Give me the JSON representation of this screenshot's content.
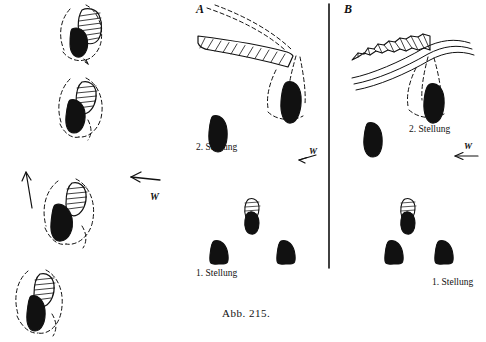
{
  "figure": {
    "caption": "Abb. 215.",
    "panels": [
      {
        "id": "A",
        "letter": "A"
      },
      {
        "id": "B",
        "letter": "B"
      }
    ],
    "labels": [
      {
        "name": "panel-a-letter",
        "text": "A",
        "x": 196,
        "y": 4
      },
      {
        "name": "panel-b-letter",
        "text": "B",
        "x": 344,
        "y": 4
      },
      {
        "name": "panel-a-second-position",
        "text": "2. Stellung",
        "x": 196,
        "y": 143
      },
      {
        "name": "panel-a-first-position",
        "text": "1. Stellung",
        "x": 196,
        "y": 268
      },
      {
        "name": "panel-b-second-position",
        "text": "2. Stellung",
        "x": 408,
        "y": 124
      },
      {
        "name": "panel-b-first-position",
        "text": "1. Stellung",
        "x": 432,
        "y": 277
      },
      {
        "name": "figure-caption",
        "text": "Abb. 215.",
        "x": 222,
        "y": 313
      }
    ],
    "direction_markers": [
      {
        "name": "arrow-marker-left-panel-up",
        "text": "",
        "x": 20,
        "y": 175
      },
      {
        "name": "arrow-marker-left-panel-w",
        "text": "W",
        "x": 150,
        "y": 196
      },
      {
        "name": "arrow-marker-panel-a-w",
        "text": "W",
        "x": 307,
        "y": 152
      },
      {
        "name": "arrow-marker-panel-b-w",
        "text": "W",
        "x": 465,
        "y": 146
      }
    ],
    "colors": {
      "ink": "#111111",
      "paper": "#ffffff"
    }
  }
}
